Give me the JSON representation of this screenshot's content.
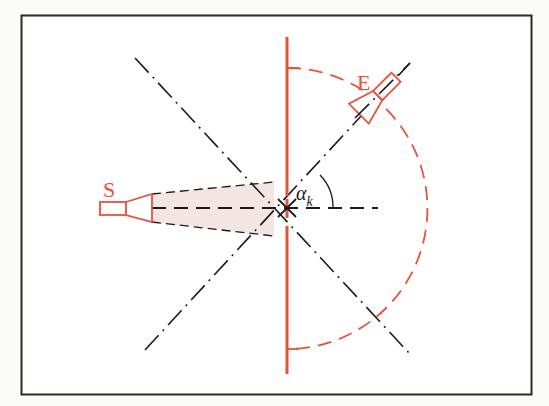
{
  "diagram": {
    "type": "scattering-geometry",
    "labels": {
      "source": "S",
      "detector": "E",
      "angle_symbol": "α",
      "angle_subscript": "k"
    },
    "colors": {
      "background": "#fbfbf8",
      "frame": "#2a2a2a",
      "red": "#e8503a",
      "black": "#1a1a1a",
      "beam_fill": "#f3e6e2"
    },
    "geometry": {
      "frame": [
        21,
        15,
        511,
        380
      ],
      "center": [
        287,
        208
      ],
      "arc_radius": 140,
      "sample_line_x": 287,
      "sample_line_y": [
        37,
        374
      ],
      "angle_deg": 45
    }
  }
}
